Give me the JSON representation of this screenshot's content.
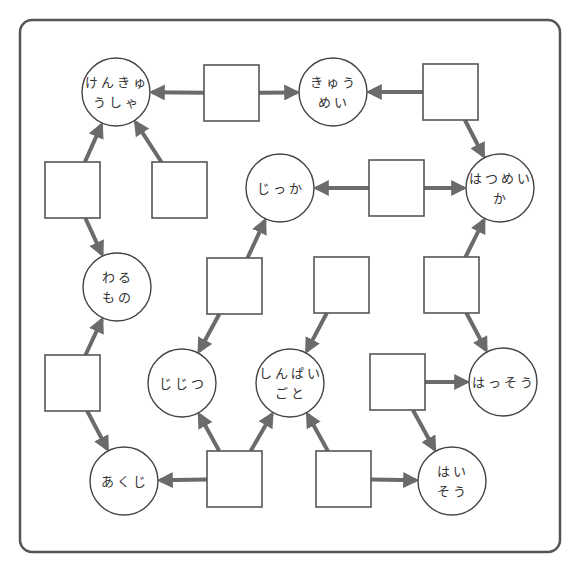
{
  "diagram": {
    "type": "word-association-puzzle",
    "colors": {
      "frame": "#555555",
      "box_stroke": "#555555",
      "node_stroke": "#444444",
      "arrow": "#6b6b6b",
      "text": "#333333",
      "background": "#ffffff"
    },
    "nodes": [
      {
        "id": "kenkyuusha",
        "lines": [
          "けんきゅ",
          "うしゃ"
        ],
        "cx": 116,
        "cy": 92
      },
      {
        "id": "kyuumei",
        "lines": [
          "きゅう",
          "めい"
        ],
        "cx": 333,
        "cy": 92
      },
      {
        "id": "jikka",
        "lines": [
          "じっか"
        ],
        "cx": 280,
        "cy": 188
      },
      {
        "id": "hatsumeika",
        "lines": [
          "はつめい",
          "か"
        ],
        "cx": 500,
        "cy": 188
      },
      {
        "id": "warumono",
        "lines": [
          "わる",
          "もの"
        ],
        "cx": 117,
        "cy": 287
      },
      {
        "id": "jijitsu",
        "lines": [
          "じじつ"
        ],
        "cx": 182,
        "cy": 383
      },
      {
        "id": "shinpaigoto",
        "lines": [
          "しんぱい",
          "ごと"
        ],
        "cx": 290,
        "cy": 383
      },
      {
        "id": "hassou",
        "lines": [
          "はっそう"
        ],
        "cx": 503,
        "cy": 382
      },
      {
        "id": "akuji",
        "lines": [
          "あくじ"
        ],
        "cx": 124,
        "cy": 481
      },
      {
        "id": "haisou",
        "lines": [
          "はい",
          "そう"
        ],
        "cx": 452,
        "cy": 481
      }
    ],
    "boxes": [
      {
        "id": "box-1",
        "x": 204,
        "y": 65,
        "value": ""
      },
      {
        "id": "box-2",
        "x": 423,
        "y": 64,
        "value": ""
      },
      {
        "id": "box-3",
        "x": 45,
        "y": 162,
        "value": ""
      },
      {
        "id": "box-4",
        "x": 152,
        "y": 162,
        "value": ""
      },
      {
        "id": "box-5",
        "x": 369,
        "y": 160,
        "value": ""
      },
      {
        "id": "box-6",
        "x": 207,
        "y": 258,
        "value": ""
      },
      {
        "id": "box-7",
        "x": 314,
        "y": 257,
        "value": ""
      },
      {
        "id": "box-8",
        "x": 424,
        "y": 257,
        "value": ""
      },
      {
        "id": "box-9",
        "x": 45,
        "y": 355,
        "value": ""
      },
      {
        "id": "box-10",
        "x": 370,
        "y": 354,
        "value": ""
      },
      {
        "id": "box-11",
        "x": 207,
        "y": 451,
        "value": ""
      },
      {
        "id": "box-12",
        "x": 316,
        "y": 451,
        "value": ""
      }
    ],
    "edges": [
      {
        "from": "box-1",
        "to": "kenkyuusha"
      },
      {
        "from": "box-1",
        "to": "kyuumei"
      },
      {
        "from": "box-2",
        "to": "kyuumei"
      },
      {
        "from": "box-2",
        "to": "hatsumeika"
      },
      {
        "from": "box-3",
        "to": "kenkyuusha"
      },
      {
        "from": "box-3",
        "to": "warumono"
      },
      {
        "from": "box-4",
        "to": "kenkyuusha"
      },
      {
        "from": "box-5",
        "to": "jikka"
      },
      {
        "from": "box-5",
        "to": "hatsumeika"
      },
      {
        "from": "box-6",
        "to": "jikka"
      },
      {
        "from": "box-6",
        "to": "jijitsu"
      },
      {
        "from": "box-7",
        "to": "shinpaigoto"
      },
      {
        "from": "box-8",
        "to": "hatsumeika"
      },
      {
        "from": "box-8",
        "to": "hassou"
      },
      {
        "from": "box-9",
        "to": "warumono"
      },
      {
        "from": "box-9",
        "to": "akuji"
      },
      {
        "from": "box-10",
        "to": "hassou"
      },
      {
        "from": "box-10",
        "to": "haisou"
      },
      {
        "from": "box-11",
        "to": "akuji"
      },
      {
        "from": "box-11",
        "to": "jijitsu"
      },
      {
        "from": "box-11",
        "to": "shinpaigoto"
      },
      {
        "from": "box-12",
        "to": "shinpaigoto"
      },
      {
        "from": "box-12",
        "to": "haisou"
      }
    ]
  }
}
